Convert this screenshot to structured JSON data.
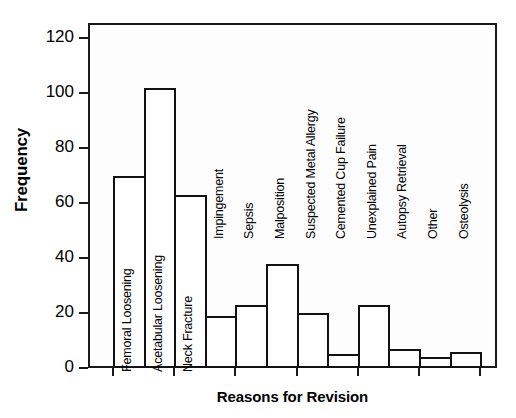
{
  "chart_data": {
    "type": "bar",
    "title": "",
    "xlabel": "Reasons for Revision",
    "ylabel": "Frequency",
    "ylim": [
      0,
      120
    ],
    "yticks": [
      0,
      20,
      40,
      60,
      80,
      100,
      120
    ],
    "grid": false,
    "legend": false,
    "categories": [
      "Femoral Loosening",
      "Acetabular Loosening",
      "Neck Fracture",
      "Impingement",
      "Sepsis",
      "Malposition",
      "Suspected Metal Allergy",
      "Cemented Cup Failure",
      "Unexplained Pain",
      "Autopsy Retrieval",
      "Other",
      "Osteolysis"
    ],
    "values": [
      70,
      102,
      63,
      19,
      23,
      38,
      20,
      5,
      23,
      7,
      4,
      6
    ],
    "bar_style": {
      "fill": "#ffffff",
      "edge": "#111111"
    }
  }
}
